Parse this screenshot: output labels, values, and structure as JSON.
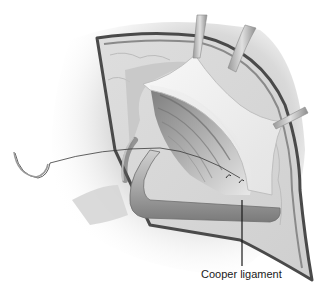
{
  "figure": {
    "type": "surgical-illustration",
    "labels": [
      {
        "text": "Cooper ligament",
        "leader_line": {
          "x": 242,
          "y1": 200,
          "y2": 272
        }
      }
    ]
  },
  "colors": {
    "background": "#ffffff",
    "skin_shadow": "#cfcfcf",
    "incision_edge": "#5a5a5a",
    "tissue_light": "#e6e6e6",
    "tissue_mid": "#b8b8b8",
    "muscle_dark": "#8a8a8a",
    "label_text": "#1a1a1a"
  }
}
